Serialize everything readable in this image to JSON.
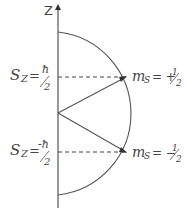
{
  "diagram": {
    "axis_label": "Z",
    "upper": {
      "left_label_main": "S",
      "left_label_sub": "Z",
      "left_label_eq": "=",
      "left_label_num": "ħ",
      "left_label_den": "2",
      "right_label_main": "m",
      "right_label_sub": "S",
      "right_label_eq": "= +",
      "right_label_num": "1",
      "right_label_den": "2"
    },
    "lower": {
      "left_label_main": "S",
      "left_label_sub": "Z",
      "left_label_eq": "=",
      "left_label_num": "-ħ",
      "left_label_den": "2",
      "right_label_main": "m",
      "right_label_sub": "S",
      "right_label_eq": "= −",
      "right_label_num": "1",
      "right_label_den": "2"
    },
    "colors": {
      "line": "#555555",
      "text": "#444444"
    }
  }
}
